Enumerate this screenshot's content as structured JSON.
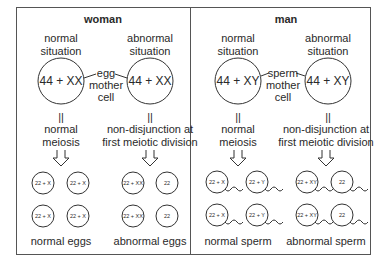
{
  "panels": [
    {
      "title": "woman",
      "left": {
        "situation_line1": "normal",
        "situation_line2": "situation",
        "karyotype": "44 + XX",
        "process_line1": "normal",
        "process_line2": "meiosis"
      },
      "right": {
        "situation_line1": "abnormal",
        "situation_line2": "situation",
        "karyotype": "44 + XX",
        "process_line1": "non-disjunction at",
        "process_line2": "first meiotic division"
      },
      "connector": {
        "line1": "egg",
        "line2": "mother",
        "line3": "cell"
      },
      "normal_cells": [
        "22 + X",
        "22 + X",
        "22 + X",
        "22 + X"
      ],
      "abnormal_cells": [
        "22 + XX",
        "22",
        "22 + XX",
        "22"
      ],
      "normal_caption": "normal eggs",
      "abnormal_caption": "abnormal eggs"
    },
    {
      "title": "man",
      "left": {
        "situation_line1": "normal",
        "situation_line2": "situation",
        "karyotype": "44 + XY",
        "process_line1": "normal",
        "process_line2": "meiosis"
      },
      "right": {
        "situation_line1": "abnormal",
        "situation_line2": "situation",
        "karyotype": "44 + XY",
        "process_line1": "non-disjunction at",
        "process_line2": "first meiotic division"
      },
      "connector": {
        "line1": "sperm",
        "line2": "mother",
        "line3": "cell"
      },
      "normal_cells": [
        "22 + X",
        "22 + Y",
        "22 + X",
        "22 + Y"
      ],
      "abnormal_cells": [
        "22 + XY",
        "22",
        "22 + XY",
        "22"
      ],
      "normal_caption": "normal sperm",
      "abnormal_caption": "abnormal sperm"
    }
  ],
  "symbols": {
    "equals_bars": "||"
  }
}
